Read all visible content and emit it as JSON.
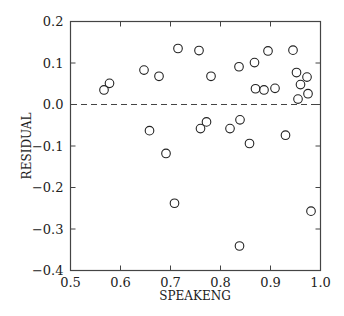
{
  "chart_data": {
    "type": "scatter",
    "title": "",
    "xlabel": "SPEAKENG",
    "ylabel": "RESIDUAL",
    "xlim": [
      0.5,
      1.0
    ],
    "ylim": [
      -0.4,
      0.2
    ],
    "xticks": [
      0.5,
      0.6,
      0.7,
      0.8,
      0.9,
      1.0
    ],
    "xtick_labels": [
      "0.5",
      "0.6",
      "0.7",
      "0.8",
      "0.9",
      "1.0"
    ],
    "yticks": [
      0.2,
      0.1,
      0.0,
      -0.1,
      -0.2,
      -0.3,
      -0.4
    ],
    "ytick_labels": [
      "0.2",
      "0.1",
      "0.0",
      "−0.1",
      "−0.2",
      "−0.3",
      "−0.4"
    ],
    "grid": false,
    "legend": null,
    "reference_line": {
      "y": 0.0,
      "style": "dashed"
    },
    "marker": "open-circle",
    "points": [
      {
        "x": 0.567,
        "y": 0.035
      },
      {
        "x": 0.578,
        "y": 0.051
      },
      {
        "x": 0.647,
        "y": 0.083
      },
      {
        "x": 0.677,
        "y": 0.068
      },
      {
        "x": 0.715,
        "y": 0.135
      },
      {
        "x": 0.757,
        "y": 0.13
      },
      {
        "x": 0.781,
        "y": 0.068
      },
      {
        "x": 0.837,
        "y": 0.091
      },
      {
        "x": 0.868,
        "y": 0.101
      },
      {
        "x": 0.895,
        "y": 0.129
      },
      {
        "x": 0.945,
        "y": 0.131
      },
      {
        "x": 0.87,
        "y": 0.038
      },
      {
        "x": 0.887,
        "y": 0.035
      },
      {
        "x": 0.909,
        "y": 0.039
      },
      {
        "x": 0.952,
        "y": 0.077
      },
      {
        "x": 0.973,
        "y": 0.066
      },
      {
        "x": 0.96,
        "y": 0.048
      },
      {
        "x": 0.975,
        "y": 0.026
      },
      {
        "x": 0.955,
        "y": 0.013
      },
      {
        "x": 0.658,
        "y": -0.063
      },
      {
        "x": 0.691,
        "y": -0.118
      },
      {
        "x": 0.708,
        "y": -0.238
      },
      {
        "x": 0.76,
        "y": -0.058
      },
      {
        "x": 0.772,
        "y": -0.042
      },
      {
        "x": 0.819,
        "y": -0.058
      },
      {
        "x": 0.839,
        "y": -0.037
      },
      {
        "x": 0.858,
        "y": -0.094
      },
      {
        "x": 0.93,
        "y": -0.074
      },
      {
        "x": 0.981,
        "y": -0.257
      },
      {
        "x": 0.838,
        "y": -0.341
      }
    ]
  },
  "colors": {
    "axis": "#444444",
    "marker": "#222222",
    "background": "#ffffff"
  }
}
